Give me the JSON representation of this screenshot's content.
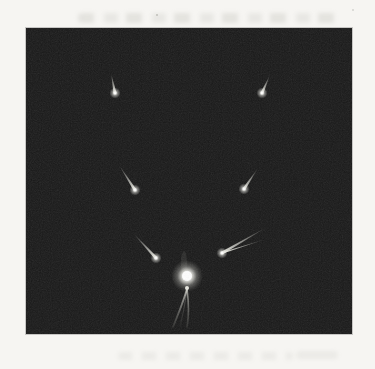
{
  "meta": {
    "visible_text": ""
  },
  "page": {
    "bg_color": "#f6f5f2",
    "showthrough_smudges": true
  },
  "photo": {
    "frame": {
      "x": 26,
      "y": 28,
      "width": 326,
      "height": 306
    },
    "bg_color": "#181818",
    "noise_opacity": 0.13,
    "head_color": "#f2f2ec",
    "tail_color": "#eeeee6",
    "sun": {
      "cx": 161,
      "cy": 248,
      "core_radius": 5,
      "glow_radius": 16,
      "knob": {
        "cx": 161,
        "cy": 260,
        "r": 2
      },
      "color": "#ffffff"
    },
    "streamers": [
      {
        "path": "M 161,261 C 157,275 151,289 147,299",
        "width": 1.8,
        "opacity": 0.85
      },
      {
        "path": "M 161,261 C 163,276 163,288 161,299",
        "width": 1.6,
        "opacity": 0.75
      },
      {
        "path": "M 161,261 C 159,278 156,290 154,299",
        "width": 1.1,
        "opacity": 0.35
      }
    ],
    "wisp_above_sun": {
      "cx": 158,
      "cy": 235,
      "rx": 3,
      "ry": 12,
      "opacity": 0.1
    },
    "comets": [
      {
        "id": "upper-left",
        "head": [
          89,
          65
        ],
        "tail_tip": [
          85,
          45
        ]
      },
      {
        "id": "upper-right",
        "head": [
          236,
          65
        ],
        "tail_tip": [
          244,
          47
        ]
      },
      {
        "id": "mid-left",
        "head": [
          109,
          162
        ],
        "tail_tip": [
          93,
          137
        ]
      },
      {
        "id": "mid-right",
        "head": [
          218,
          161
        ],
        "tail_tip": [
          232,
          140
        ]
      },
      {
        "id": "low-left",
        "head": [
          130,
          230
        ],
        "tail_tip": [
          107,
          205
        ]
      },
      {
        "id": "low-right",
        "head": [
          196,
          225
        ],
        "tail_tip": [
          241,
          199
        ],
        "tail2_tip": [
          237,
          212
        ]
      }
    ]
  }
}
